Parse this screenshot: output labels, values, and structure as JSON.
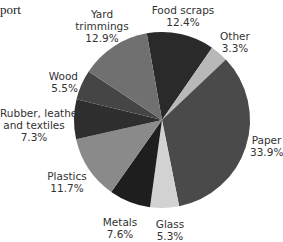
{
  "title_fragment": "port",
  "chart_data": {
    "type": "pie",
    "title": "",
    "start_angle_deg": -10,
    "direction": "clockwise",
    "center": [
      162,
      120
    ],
    "radius": 88,
    "slices": [
      {
        "label": "Food scraps",
        "value": 12.4,
        "display": "12.4%",
        "color": "#2a2a2a"
      },
      {
        "label": "Other",
        "value": 3.3,
        "display": "3.3%",
        "color": "#b8b8b8"
      },
      {
        "label": "Paper",
        "value": 33.9,
        "display": "33.9%",
        "color": "#4a4a4a"
      },
      {
        "label": "Glass",
        "value": 5.3,
        "display": "5.3%",
        "color": "#d2d2d2"
      },
      {
        "label": "Metals",
        "value": 7.6,
        "display": "7.6%",
        "color": "#1e1e1e"
      },
      {
        "label": "Plastics",
        "value": 11.7,
        "display": "11.7%",
        "color": "#8a8a8a"
      },
      {
        "label": "Rubber, leather and textiles",
        "value": 7.3,
        "display": "7.3%",
        "color": "#2e2e2e"
      },
      {
        "label": "Wood",
        "value": 5.5,
        "display": "5.5%",
        "color": "#454545"
      },
      {
        "label": "Yard trimmings",
        "value": 12.9,
        "display": "12.9%",
        "color": "#707070"
      }
    ]
  },
  "labels": {
    "food": {
      "line1": "Food scraps",
      "pct": "12.4%"
    },
    "other": {
      "line1": "Other",
      "pct": "3.3%"
    },
    "paper": {
      "line1": "Paper",
      "pct": "33.9%"
    },
    "glass": {
      "line1": "Glass",
      "pct": "5.3%"
    },
    "metals": {
      "line1": "Metals",
      "pct": "7.6%"
    },
    "plastics": {
      "line1": "Plastics",
      "pct": "11.7%"
    },
    "rubber": {
      "line1": "Rubber, leather",
      "line2": "and textiles",
      "pct": "7.3%"
    },
    "wood": {
      "line1": "Wood",
      "pct": "5.5%"
    },
    "yard": {
      "line1": "Yard",
      "line2": "trimmings",
      "pct": "12.9%"
    }
  }
}
